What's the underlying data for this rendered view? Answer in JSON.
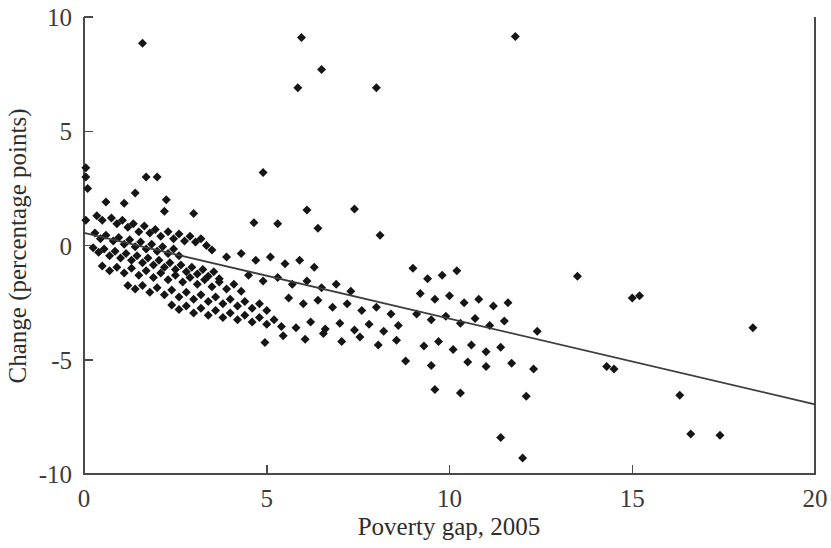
{
  "chart_data": {
    "type": "scatter",
    "title": "",
    "xlabel": "Poverty gap, 2005",
    "ylabel": "Change (percentage points)",
    "xlim": [
      0,
      20
    ],
    "ylim": [
      -10,
      10
    ],
    "xticks": [
      0,
      5,
      10,
      15,
      20
    ],
    "yticks": [
      -10,
      -5,
      0,
      5,
      10
    ],
    "xtick_labels": [
      "0",
      "5",
      "10",
      "15",
      "20"
    ],
    "ytick_labels": [
      "-10",
      "-5",
      "0",
      "5",
      "10"
    ],
    "grid": false,
    "legend": null,
    "marker": "diamond",
    "marker_color": "#151515",
    "marker_size": 9,
    "trendline": {
      "type": "linear-fit",
      "color": "#3d3d3d",
      "x_start": 0.0,
      "y_start": 0.55,
      "x_end": 20.0,
      "y_end": -6.95,
      "slope": -0.375,
      "intercept": 0.55
    },
    "points": [
      [
        0.05,
        3.4
      ],
      [
        0.05,
        3.0
      ],
      [
        0.1,
        2.5
      ],
      [
        0.05,
        1.1
      ],
      [
        1.6,
        8.85
      ],
      [
        5.95,
        9.1
      ],
      [
        11.8,
        9.15
      ],
      [
        6.5,
        7.7
      ],
      [
        5.85,
        6.9
      ],
      [
        8.0,
        6.9
      ],
      [
        1.7,
        3.0
      ],
      [
        2.0,
        3.0
      ],
      [
        4.9,
        3.2
      ],
      [
        1.4,
        2.3
      ],
      [
        2.25,
        2.0
      ],
      [
        0.6,
        1.9
      ],
      [
        1.1,
        1.85
      ],
      [
        2.2,
        1.5
      ],
      [
        3.0,
        1.4
      ],
      [
        6.1,
        1.55
      ],
      [
        7.4,
        1.6
      ],
      [
        4.65,
        1.0
      ],
      [
        5.3,
        0.95
      ],
      [
        6.4,
        0.75
      ],
      [
        8.1,
        0.45
      ],
      [
        0.35,
        1.3
      ],
      [
        0.5,
        1.1
      ],
      [
        0.75,
        1.2
      ],
      [
        0.9,
        0.95
      ],
      [
        1.05,
        1.1
      ],
      [
        1.2,
        0.8
      ],
      [
        1.35,
        0.95
      ],
      [
        1.5,
        0.6
      ],
      [
        1.65,
        0.85
      ],
      [
        1.8,
        0.55
      ],
      [
        1.95,
        0.7
      ],
      [
        2.1,
        0.4
      ],
      [
        2.3,
        0.6
      ],
      [
        2.45,
        0.3
      ],
      [
        2.6,
        0.5
      ],
      [
        2.75,
        0.2
      ],
      [
        2.9,
        0.4
      ],
      [
        3.05,
        0.15
      ],
      [
        3.2,
        0.3
      ],
      [
        3.35,
        0.0
      ],
      [
        0.3,
        0.55
      ],
      [
        0.45,
        0.3
      ],
      [
        0.6,
        0.45
      ],
      [
        0.8,
        0.2
      ],
      [
        0.95,
        0.35
      ],
      [
        1.1,
        0.05
      ],
      [
        1.25,
        0.25
      ],
      [
        1.4,
        -0.05
      ],
      [
        1.55,
        0.15
      ],
      [
        1.7,
        -0.15
      ],
      [
        1.85,
        0.05
      ],
      [
        2.0,
        -0.25
      ],
      [
        2.15,
        -0.05
      ],
      [
        2.3,
        -0.35
      ],
      [
        2.45,
        -0.15
      ],
      [
        2.6,
        -0.45
      ],
      [
        0.25,
        -0.1
      ],
      [
        0.4,
        -0.3
      ],
      [
        0.55,
        -0.15
      ],
      [
        0.7,
        -0.45
      ],
      [
        0.85,
        -0.25
      ],
      [
        1.0,
        -0.55
      ],
      [
        1.15,
        -0.35
      ],
      [
        1.3,
        -0.65
      ],
      [
        1.45,
        -0.45
      ],
      [
        1.6,
        -0.75
      ],
      [
        1.75,
        -0.55
      ],
      [
        1.9,
        -0.85
      ],
      [
        2.05,
        -0.65
      ],
      [
        2.2,
        -0.95
      ],
      [
        2.35,
        -0.75
      ],
      [
        2.5,
        -1.05
      ],
      [
        2.65,
        -0.85
      ],
      [
        2.8,
        -1.15
      ],
      [
        2.95,
        -0.95
      ],
      [
        3.1,
        -1.25
      ],
      [
        3.25,
        -1.05
      ],
      [
        3.4,
        -1.35
      ],
      [
        3.55,
        -1.15
      ],
      [
        3.7,
        -1.45
      ],
      [
        0.5,
        -0.9
      ],
      [
        0.7,
        -1.1
      ],
      [
        0.9,
        -0.95
      ],
      [
        1.1,
        -1.2
      ],
      [
        1.3,
        -1.0
      ],
      [
        1.5,
        -1.3
      ],
      [
        1.7,
        -1.1
      ],
      [
        1.9,
        -1.4
      ],
      [
        2.1,
        -1.2
      ],
      [
        2.3,
        -1.5
      ],
      [
        2.5,
        -1.3
      ],
      [
        2.7,
        -1.6
      ],
      [
        2.9,
        -1.4
      ],
      [
        3.1,
        -1.7
      ],
      [
        3.3,
        -1.5
      ],
      [
        3.5,
        -1.8
      ],
      [
        3.7,
        -1.6
      ],
      [
        3.9,
        -1.9
      ],
      [
        4.1,
        -1.7
      ],
      [
        4.3,
        -2.0
      ],
      [
        1.2,
        -1.75
      ],
      [
        1.4,
        -1.9
      ],
      [
        1.6,
        -1.75
      ],
      [
        1.8,
        -2.05
      ],
      [
        2.0,
        -1.85
      ],
      [
        2.2,
        -2.15
      ],
      [
        2.4,
        -1.95
      ],
      [
        2.6,
        -2.25
      ],
      [
        2.8,
        -2.05
      ],
      [
        3.0,
        -2.35
      ],
      [
        3.2,
        -2.15
      ],
      [
        3.4,
        -2.45
      ],
      [
        3.6,
        -2.25
      ],
      [
        3.8,
        -2.55
      ],
      [
        4.0,
        -2.35
      ],
      [
        4.2,
        -2.65
      ],
      [
        4.4,
        -2.45
      ],
      [
        4.6,
        -2.75
      ],
      [
        4.8,
        -2.55
      ],
      [
        5.0,
        -2.85
      ],
      [
        2.4,
        -2.6
      ],
      [
        2.6,
        -2.8
      ],
      [
        2.8,
        -2.65
      ],
      [
        3.0,
        -2.95
      ],
      [
        3.2,
        -2.75
      ],
      [
        3.4,
        -3.05
      ],
      [
        3.6,
        -2.85
      ],
      [
        3.8,
        -3.15
      ],
      [
        4.0,
        -2.95
      ],
      [
        4.2,
        -3.25
      ],
      [
        4.4,
        -3.05
      ],
      [
        4.6,
        -3.35
      ],
      [
        4.8,
        -3.15
      ],
      [
        5.0,
        -3.45
      ],
      [
        5.2,
        -3.25
      ],
      [
        5.4,
        -3.55
      ],
      [
        3.5,
        -0.2
      ],
      [
        3.9,
        -0.5
      ],
      [
        4.3,
        -0.35
      ],
      [
        4.7,
        -0.65
      ],
      [
        5.1,
        -0.5
      ],
      [
        5.5,
        -0.8
      ],
      [
        5.9,
        -0.65
      ],
      [
        6.3,
        -0.95
      ],
      [
        4.5,
        -1.3
      ],
      [
        4.9,
        -1.55
      ],
      [
        5.3,
        -1.4
      ],
      [
        5.7,
        -1.7
      ],
      [
        6.1,
        -1.55
      ],
      [
        6.5,
        -1.85
      ],
      [
        6.9,
        -1.7
      ],
      [
        7.3,
        -2.0
      ],
      [
        5.6,
        -2.3
      ],
      [
        6.0,
        -2.55
      ],
      [
        6.4,
        -2.4
      ],
      [
        6.8,
        -2.7
      ],
      [
        7.2,
        -2.55
      ],
      [
        7.6,
        -2.85
      ],
      [
        8.0,
        -2.7
      ],
      [
        8.4,
        -3.0
      ],
      [
        5.8,
        -3.6
      ],
      [
        6.2,
        -3.35
      ],
      [
        6.6,
        -3.65
      ],
      [
        7.0,
        -3.4
      ],
      [
        7.4,
        -3.7
      ],
      [
        7.8,
        -3.45
      ],
      [
        8.2,
        -3.75
      ],
      [
        8.6,
        -3.5
      ],
      [
        4.95,
        -4.25
      ],
      [
        5.45,
        -3.95
      ],
      [
        6.05,
        -4.1
      ],
      [
        6.55,
        -3.85
      ],
      [
        7.05,
        -4.2
      ],
      [
        7.55,
        -4.0
      ],
      [
        8.05,
        -4.35
      ],
      [
        8.55,
        -4.15
      ],
      [
        9.0,
        -1.0
      ],
      [
        9.4,
        -1.45
      ],
      [
        9.8,
        -1.3
      ],
      [
        10.2,
        -1.1
      ],
      [
        9.2,
        -2.1
      ],
      [
        9.6,
        -2.35
      ],
      [
        10.0,
        -2.2
      ],
      [
        10.4,
        -2.5
      ],
      [
        10.8,
        -2.35
      ],
      [
        11.2,
        -2.65
      ],
      [
        11.6,
        -2.5
      ],
      [
        9.1,
        -3.0
      ],
      [
        9.5,
        -3.25
      ],
      [
        9.9,
        -3.1
      ],
      [
        10.3,
        -3.4
      ],
      [
        10.7,
        -3.2
      ],
      [
        11.1,
        -3.5
      ],
      [
        11.5,
        -3.3
      ],
      [
        12.4,
        -3.75
      ],
      [
        9.3,
        -4.4
      ],
      [
        9.7,
        -4.2
      ],
      [
        10.1,
        -4.55
      ],
      [
        10.6,
        -4.35
      ],
      [
        11.0,
        -4.65
      ],
      [
        11.4,
        -4.45
      ],
      [
        8.8,
        -5.05
      ],
      [
        9.5,
        -5.25
      ],
      [
        10.5,
        -5.1
      ],
      [
        11.0,
        -5.3
      ],
      [
        11.7,
        -5.15
      ],
      [
        12.3,
        -5.4
      ],
      [
        9.6,
        -6.3
      ],
      [
        10.3,
        -6.45
      ],
      [
        12.1,
        -6.6
      ],
      [
        11.4,
        -8.4
      ],
      [
        12.0,
        -9.3
      ],
      [
        13.5,
        -1.35
      ],
      [
        15.0,
        -2.3
      ],
      [
        15.2,
        -2.2
      ],
      [
        18.3,
        -3.6
      ],
      [
        14.3,
        -5.3
      ],
      [
        14.5,
        -5.4
      ],
      [
        16.3,
        -6.55
      ],
      [
        16.6,
        -8.25
      ],
      [
        17.4,
        -8.3
      ]
    ]
  },
  "axes": {
    "x_axis_name": "Poverty gap, 2005",
    "y_axis_name": "Change (percentage points)"
  }
}
